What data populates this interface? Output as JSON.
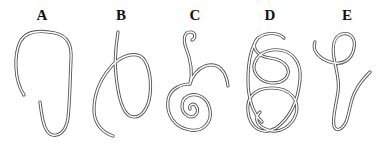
{
  "figure": {
    "panels": [
      {
        "label": "A",
        "x": 42
      },
      {
        "label": "B",
        "x": 121
      },
      {
        "label": "C",
        "x": 195
      },
      {
        "label": "D",
        "x": 270
      },
      {
        "label": "E",
        "x": 347
      }
    ],
    "stroke_color": "#555555",
    "background": "#ffffff"
  }
}
